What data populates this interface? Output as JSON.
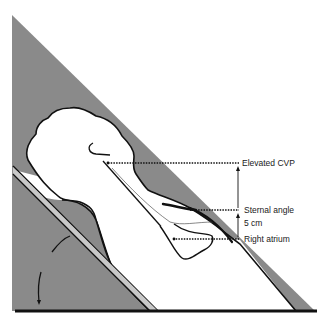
{
  "figure": {
    "colors": {
      "background": "#ffffff",
      "triangle_fill": "#8a8a8a",
      "outline": "#111111",
      "body_fill": "#ffffff"
    },
    "labels": {
      "elevated_cvp": "Elevated CVP",
      "sternal_angle": "Sternal angle",
      "distance": "5 cm",
      "right_atrium": "Right atrium"
    },
    "levels": {
      "elevated_cvp_y": 163,
      "sternal_angle_y": 210,
      "right_atrium_y": 239
    }
  }
}
